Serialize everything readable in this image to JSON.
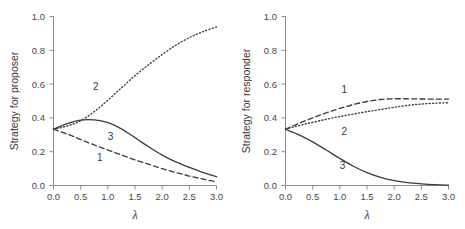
{
  "figure": {
    "background": "#ffffff",
    "line_color": "#3d3d3d",
    "axis_color": "#8c8c8c",
    "text_color": "#3a3a3a"
  },
  "chart_data": [
    {
      "type": "line",
      "title": "",
      "panel": "left",
      "xlabel": "λ",
      "ylabel": "Strategy for proposer",
      "xlim": [
        0.0,
        3.0
      ],
      "ylim": [
        0.0,
        1.0
      ],
      "grid": false,
      "legend": "inline-labels",
      "xticks": [
        0.0,
        0.5,
        1.0,
        1.5,
        2.0,
        2.5,
        3.0
      ],
      "xticklabels": [
        "0.0",
        "0.5",
        "1.0",
        "1.5",
        "2.0",
        "2.5",
        "3.0"
      ],
      "yticks": [
        0.0,
        0.2,
        0.4,
        0.6,
        0.8,
        1.0
      ],
      "yticklabels": [
        "0.0",
        "0.2",
        "0.4",
        "0.6",
        "0.8",
        "1.0"
      ],
      "x": [
        0.0,
        0.25,
        0.5,
        0.75,
        1.0,
        1.25,
        1.5,
        1.75,
        2.0,
        2.25,
        2.5,
        2.75,
        3.0
      ],
      "series": [
        {
          "name": "1",
          "style": "dashed",
          "label": "1",
          "label_x": 0.85,
          "label_y": 0.145,
          "values": [
            0.333,
            0.305,
            0.272,
            0.24,
            0.21,
            0.181,
            0.152,
            0.126,
            0.1,
            0.077,
            0.056,
            0.038,
            0.022
          ]
        },
        {
          "name": "2",
          "style": "dotted",
          "label": "2",
          "label_x": 0.78,
          "label_y": 0.565,
          "values": [
            0.333,
            0.352,
            0.383,
            0.437,
            0.505,
            0.578,
            0.65,
            0.715,
            0.775,
            0.83,
            0.875,
            0.91,
            0.938
          ]
        },
        {
          "name": "3",
          "style": "solid",
          "label": "3",
          "label_x": 1.05,
          "label_y": 0.268,
          "values": [
            0.333,
            0.366,
            0.387,
            0.388,
            0.372,
            0.335,
            0.283,
            0.229,
            0.18,
            0.14,
            0.108,
            0.078,
            0.052
          ]
        }
      ]
    },
    {
      "type": "line",
      "title": "",
      "panel": "right",
      "xlabel": "λ",
      "ylabel": "Strategy for responder",
      "xlim": [
        0.0,
        3.0
      ],
      "ylim": [
        0.0,
        1.0
      ],
      "grid": false,
      "legend": "inline-labels",
      "xticks": [
        0.0,
        0.5,
        1.0,
        1.5,
        2.0,
        2.5,
        3.0
      ],
      "xticklabels": [
        "0.0",
        "0.5",
        "1.0",
        "1.5",
        "2.0",
        "2.5",
        "3.0"
      ],
      "yticks": [
        0.0,
        0.2,
        0.4,
        0.6,
        0.8,
        1.0
      ],
      "yticklabels": [
        "0.0",
        "0.2",
        "0.4",
        "0.6",
        "0.8",
        "1.0"
      ],
      "x": [
        0.0,
        0.25,
        0.5,
        0.75,
        1.0,
        1.25,
        1.5,
        1.75,
        2.0,
        2.25,
        2.5,
        2.75,
        3.0
      ],
      "series": [
        {
          "name": "1",
          "style": "dashed",
          "label": "1",
          "label_x": 1.08,
          "label_y": 0.545,
          "values": [
            0.333,
            0.368,
            0.4,
            0.43,
            0.456,
            0.479,
            0.497,
            0.509,
            0.513,
            0.513,
            0.512,
            0.511,
            0.511
          ]
        },
        {
          "name": "2",
          "style": "dotted",
          "label": "2",
          "label_x": 1.08,
          "label_y": 0.3,
          "values": [
            0.333,
            0.355,
            0.374,
            0.392,
            0.408,
            0.423,
            0.437,
            0.45,
            0.463,
            0.474,
            0.482,
            0.487,
            0.49
          ]
        },
        {
          "name": "3",
          "style": "solid",
          "label": "3",
          "label_x": 1.05,
          "label_y": 0.098,
          "values": [
            0.333,
            0.3,
            0.258,
            0.21,
            0.16,
            0.114,
            0.076,
            0.048,
            0.029,
            0.017,
            0.01,
            0.005,
            0.002
          ]
        }
      ]
    }
  ]
}
